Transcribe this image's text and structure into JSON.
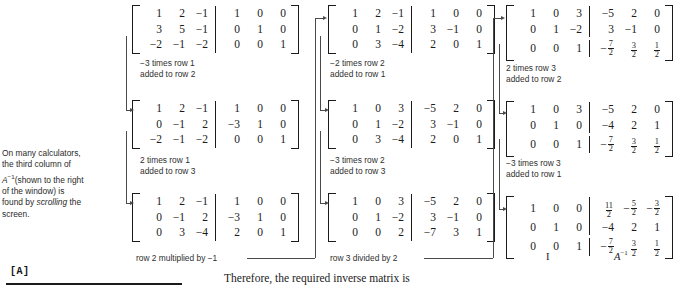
{
  "note": {
    "line1": "On many calculators,",
    "line2": "the third column of",
    "line3_italic": "A",
    "line3_sup": "−1",
    "line3_rest": "(shown to the right",
    "line4": "of the window) is",
    "line5_pre": "found by ",
    "line5_italic": "scrolling",
    "line5_post": " the",
    "line6": "screen."
  },
  "calculator": {
    "label": "[A]"
  },
  "caption": "Therefore, the required inverse matrix is",
  "bottom_labels": {
    "identity": "I",
    "inverse_base": "A",
    "inverse_sup": "−1"
  },
  "matrices": [
    {
      "id": "m1",
      "rows": [
        [
          "1",
          "2",
          "−1",
          "1",
          "0",
          "0"
        ],
        [
          "3",
          "5",
          "−1",
          "0",
          "1",
          "0"
        ],
        [
          "−2",
          "−1",
          "−2",
          "0",
          "0",
          "1"
        ]
      ]
    },
    {
      "id": "m2",
      "rows": [
        [
          "1",
          "2",
          "−1",
          "1",
          "0",
          "0"
        ],
        [
          "0",
          "−1",
          "2",
          "−3",
          "1",
          "0"
        ],
        [
          "−2",
          "−1",
          "−2",
          "0",
          "0",
          "1"
        ]
      ]
    },
    {
      "id": "m3",
      "rows": [
        [
          "1",
          "2",
          "−1",
          "1",
          "0",
          "0"
        ],
        [
          "0",
          "−1",
          "2",
          "−3",
          "1",
          "0"
        ],
        [
          "0",
          "3",
          "−4",
          "2",
          "0",
          "1"
        ]
      ]
    },
    {
      "id": "m4",
      "rows": [
        [
          "1",
          "2",
          "−1",
          "1",
          "0",
          "0"
        ],
        [
          "0",
          "1",
          "−2",
          "3",
          "−1",
          "0"
        ],
        [
          "0",
          "3",
          "−4",
          "2",
          "0",
          "1"
        ]
      ]
    },
    {
      "id": "m5",
      "rows": [
        [
          "1",
          "0",
          "3",
          "−5",
          "2",
          "0"
        ],
        [
          "0",
          "1",
          "−2",
          "3",
          "−1",
          "0"
        ],
        [
          "0",
          "3",
          "−4",
          "2",
          "0",
          "1"
        ]
      ]
    },
    {
      "id": "m6",
      "rows": [
        [
          "1",
          "0",
          "3",
          "−5",
          "2",
          "0"
        ],
        [
          "0",
          "1",
          "−2",
          "3",
          "−1",
          "0"
        ],
        [
          "0",
          "0",
          "2",
          "−7",
          "3",
          "1"
        ]
      ]
    },
    {
      "id": "m7",
      "rows": [
        [
          "1",
          "0",
          "3",
          "−5",
          "2",
          "0"
        ],
        [
          "0",
          "1",
          "−2",
          "3",
          "−1",
          "0"
        ],
        [
          "0",
          "0",
          "1",
          "-7/2",
          "3/2",
          "1/2"
        ]
      ]
    },
    {
      "id": "m8",
      "rows": [
        [
          "1",
          "0",
          "3",
          "−5",
          "2",
          "0"
        ],
        [
          "0",
          "1",
          "0",
          "−4",
          "2",
          "1"
        ],
        [
          "0",
          "0",
          "1",
          "-7/2",
          "3/2",
          "1/2"
        ]
      ]
    },
    {
      "id": "m9",
      "rows": [
        [
          "1",
          "0",
          "0",
          "11/2",
          "-5/2",
          "-3/2"
        ],
        [
          "0",
          "1",
          "0",
          "−4",
          "2",
          "1"
        ],
        [
          "0",
          "0",
          "1",
          "-7/2",
          "3/2",
          "1/2"
        ]
      ]
    }
  ],
  "operations": {
    "op1": "−3 times row 1\nadded to row 2",
    "op2": "2 times row 1\nadded to row 3",
    "op3": "row 2 multiplied by −1",
    "op4": "−2 times row 2\nadded to row 1",
    "op5": "−3 times row 2\nadded to row 3",
    "op6": "row 3 divided by 2",
    "op7": "2 times row 3\nadded to row 2",
    "op8": "−3 times row 3\nadded to row 1"
  }
}
